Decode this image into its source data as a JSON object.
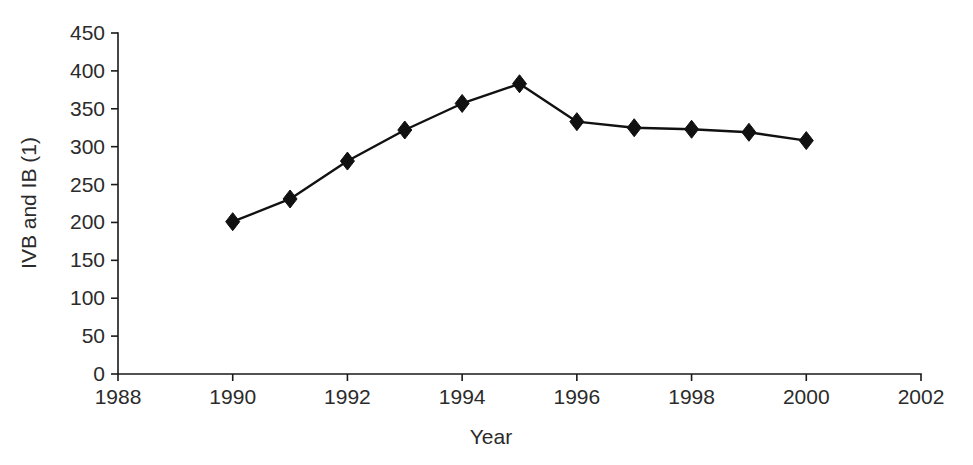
{
  "chart_data": {
    "type": "line",
    "title": "",
    "xlabel": "Year",
    "ylabel": "IVB and IB (1)",
    "x": [
      1990,
      1991,
      1992,
      1993,
      1994,
      1995,
      1996,
      1997,
      1998,
      1999,
      2000
    ],
    "values": [
      201,
      231,
      281,
      322,
      357,
      383,
      333,
      325,
      323,
      319,
      308
    ],
    "series": [
      {
        "name": "IVB and IB (1)",
        "x": [
          1990,
          1991,
          1992,
          1993,
          1994,
          1995,
          1996,
          1997,
          1998,
          1999,
          2000
        ],
        "values": [
          201,
          231,
          281,
          322,
          357,
          383,
          333,
          325,
          323,
          319,
          308
        ]
      }
    ],
    "xlim": [
      1988,
      2002
    ],
    "ylim": [
      0,
      450
    ],
    "xticks": [
      1988,
      1990,
      1992,
      1994,
      1996,
      1998,
      2000,
      2002
    ],
    "xtick_labels": [
      "1988",
      "1990",
      "1992",
      "1994",
      "1996",
      "1998",
      "2000",
      "2002"
    ],
    "yticks": [
      0,
      50,
      100,
      150,
      200,
      250,
      300,
      350,
      400,
      450
    ],
    "ytick_labels": [
      "0",
      "50",
      "100",
      "150",
      "200",
      "250",
      "300",
      "350",
      "400",
      "450"
    ],
    "grid": false,
    "legend": false,
    "legend_position": "none",
    "marker": "diamond",
    "marker_color": "#111111",
    "line_color": "#111111",
    "background_color": "#ffffff",
    "annotations": []
  }
}
